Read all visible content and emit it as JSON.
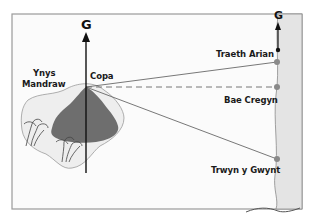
{
  "diagram": {
    "north_label_main": "G",
    "north_label_coast": "G",
    "island_name_line1": "Ynys",
    "island_name_line2": "Mandraw",
    "peak_label": "Copa",
    "points": [
      {
        "label": "Traeth Arian"
      },
      {
        "label": "Bae Cregyn"
      },
      {
        "label": "Trwyn y Gwynt"
      }
    ],
    "colors": {
      "frame": "#9a9a9a",
      "sea_strip": "#e2e2e2",
      "island_sand": "#efefef",
      "mountain": "#6e6e6e",
      "point_dot": "#8a8a8a",
      "lines": "#555555",
      "north_arrow": "#111111"
    }
  }
}
